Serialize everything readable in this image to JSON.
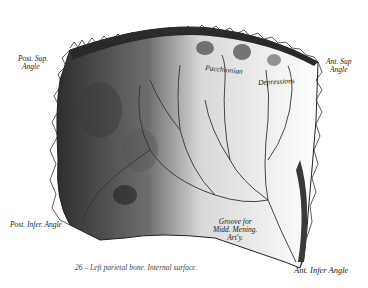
{
  "figure": {
    "caption": "26 – Left parietal bone. Internal surface.",
    "labels": {
      "post_sup_angle_1": "Post. Sup.",
      "post_sup_angle_2": "Angle",
      "ant_sup_angle_1": "Ant. Sup",
      "ant_sup_angle_2": "Angle",
      "pacchionian": "Pacchionian",
      "depressions": "Depressions",
      "post_infer_angle": "Post. Infer. Angle",
      "groove_1": "Groove for",
      "groove_2": "Midd. Mening.",
      "groove_3": "Art'y.",
      "ant_infer_angle": "Ant. Infer Angle"
    },
    "colors": {
      "ink": "#222222",
      "shadow": "#3a3a3a",
      "paper": "#ffffff"
    }
  }
}
